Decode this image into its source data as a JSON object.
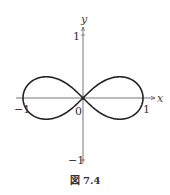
{
  "chart_data": {
    "type": "line",
    "title": "",
    "curve": "lemniscate of Bernoulli",
    "equation": "(x^2 + y^2)^2 = x^2 - y^2",
    "xlabel": "x",
    "ylabel": "y",
    "xlim": [
      -1.15,
      1.15
    ],
    "ylim": [
      -1.1,
      1.1
    ],
    "x_ticks": [
      -1,
      1
    ],
    "y_ticks": [
      -1,
      1
    ],
    "x_tick_labels": [
      "−1",
      "1"
    ],
    "y_tick_labels": [
      "−1",
      "1"
    ],
    "origin_label": "0",
    "grid": false,
    "legend": null,
    "key_points": [
      {
        "x": -1,
        "y": 0
      },
      {
        "x": 0,
        "y": 0
      },
      {
        "x": 1,
        "y": 0
      },
      {
        "x": -0.61,
        "y": 0.35
      },
      {
        "x": 0.61,
        "y": 0.35
      },
      {
        "x": -0.61,
        "y": -0.35
      },
      {
        "x": 0.61,
        "y": -0.35
      }
    ],
    "line_color": "#222222",
    "axis_color": "#555555"
  },
  "labels": {
    "x_axis": "x",
    "y_axis": "y",
    "origin": "0",
    "x_pos_one": "1",
    "x_neg_one": "−1",
    "y_pos_one": "1",
    "y_neg_one": "−1"
  },
  "caption": {
    "symbol": "図",
    "number": "7.4",
    "text": "図 7.4"
  }
}
